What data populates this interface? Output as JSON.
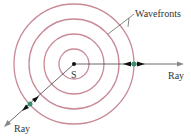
{
  "diagram": {
    "source_label": "S",
    "wavefronts_label": "Wavefronts",
    "ray_right_label": "Ray",
    "ray_left_label": "Ray",
    "colors": {
      "wavefront": "#c98a96",
      "ray": "#333333",
      "marker": "#3a8f6a",
      "text": "#333333"
    },
    "center": [
      74,
      64
    ],
    "radii": [
      15,
      30,
      45,
      60
    ]
  }
}
